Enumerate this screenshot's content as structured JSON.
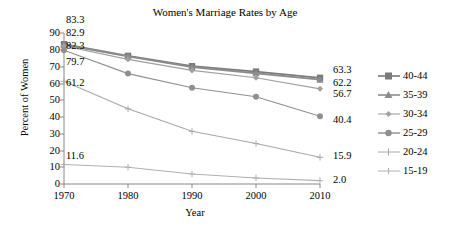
{
  "chart_data": {
    "type": "line",
    "title": "Women's Marriage Rates by Age",
    "xlabel": "Year",
    "ylabel": "Percent of Women",
    "x": [
      1970,
      1980,
      1990,
      2000,
      2010
    ],
    "xtick_labels": [
      "1970",
      "1980",
      "1990",
      "2000",
      "2010"
    ],
    "ytick_labels": [
      "0",
      "10",
      "20",
      "30",
      "40",
      "50",
      "60",
      "70",
      "80",
      "90"
    ],
    "ylim": [
      0,
      90
    ],
    "xlim": [
      1970,
      2010
    ],
    "grid": false,
    "legend_position": "right",
    "series": [
      {
        "name": "40-44",
        "marker": "square",
        "color": "#7b7b7b",
        "values": [
          83.3,
          76.4,
          70.2,
          67.0,
          63.3
        ],
        "start_label": "83.3",
        "end_label": "63.3"
      },
      {
        "name": "35-39",
        "marker": "triangle",
        "color": "#8c8c8c",
        "values": [
          82.9,
          76.0,
          69.6,
          66.0,
          62.2
        ],
        "start_label": "82.9",
        "end_label": "62.2"
      },
      {
        "name": "30-34",
        "marker": "diamond",
        "color": "#a0a0a0",
        "values": [
          82.3,
          74.3,
          67.7,
          63.3,
          56.7
        ],
        "start_label": "82.3",
        "end_label": "56.7"
      },
      {
        "name": "25-29",
        "marker": "circle",
        "color": "#8f8f8f",
        "values": [
          79.7,
          65.8,
          57.4,
          52.0,
          40.4
        ],
        "start_label": "79.7",
        "end_label": "40.4"
      },
      {
        "name": "20-24",
        "marker": "plus",
        "color": "#a8a8a8",
        "values": [
          61.2,
          44.8,
          31.4,
          24.1,
          15.9
        ],
        "start_label": "61.2",
        "end_label": "15.9"
      },
      {
        "name": "15-19",
        "marker": "plus",
        "color": "#b0b0b0",
        "values": [
          11.6,
          10.0,
          6.0,
          3.6,
          2.0
        ],
        "start_label": "11.6",
        "end_label": "2.0"
      }
    ]
  },
  "legend": {
    "items": [
      {
        "label": "40-44"
      },
      {
        "label": "35-39"
      },
      {
        "label": "30-34"
      },
      {
        "label": "25-29"
      },
      {
        "label": "20-24"
      },
      {
        "label": "15-19"
      }
    ]
  },
  "left_labels": [
    {
      "text": "83.3"
    },
    {
      "text": "82.9"
    },
    {
      "text": "82.3"
    },
    {
      "text": "79.7"
    },
    {
      "text": "61.2"
    },
    {
      "text": "11.6"
    }
  ],
  "right_labels": [
    {
      "text": "63.3"
    },
    {
      "text": "62.2"
    },
    {
      "text": "56.7"
    },
    {
      "text": "40.4"
    },
    {
      "text": "15.9"
    },
    {
      "text": "2.0"
    }
  ]
}
